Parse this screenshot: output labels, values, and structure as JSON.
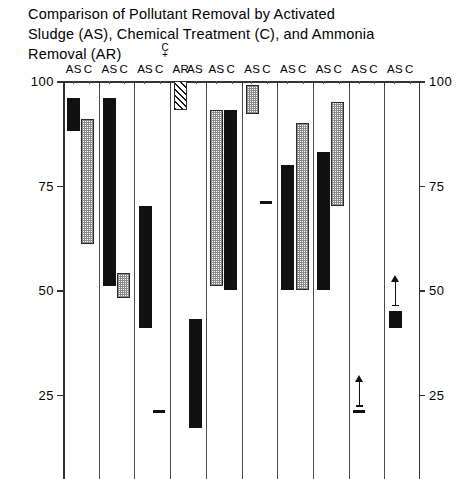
{
  "figure": {
    "title": "Comparison of Pollutant Removal by Activated\nSludge (AS), Chemical Treatment (C), and Ammonia\nRemoval (AR)",
    "width": 462,
    "height": 479,
    "ar_note": {
      "c": "C",
      "plus": "+"
    }
  },
  "chart_data": {
    "type": "bar",
    "subtype": "range-bar (floating bar showing min-max percent removal)",
    "title": "Comparison of Pollutant Removal by Activated Sludge (AS), Chemical Treatment (C), and Ammonia Removal (AR)",
    "xlabel": "",
    "ylabel": "PERCENT REMOVAL FROM RAW SEWAGE",
    "ylim": [
      0,
      100
    ],
    "yticks": [
      100,
      75,
      50,
      25
    ],
    "ytick_labels": [
      "100",
      "75",
      "50",
      "25"
    ],
    "y_axis_duplicated_right": true,
    "grid": false,
    "legend": null,
    "column_headers": [
      "AS",
      "C",
      "AS",
      "C",
      "AS",
      "C",
      "AR",
      "AS",
      "C",
      "AS",
      "C",
      "AS",
      "C",
      "AS",
      "C",
      "AS",
      "C",
      "AS",
      "C",
      "AS",
      "C"
    ],
    "groups": [
      {
        "index": 1,
        "series": [
          {
            "name": "AS",
            "fill": "solid",
            "low": 88,
            "high": 96,
            "marker": null,
            "arrow": false
          },
          {
            "name": "C",
            "fill": "stipple",
            "low": 61,
            "high": 91,
            "marker": null,
            "arrow": false
          }
        ]
      },
      {
        "index": 2,
        "series": [
          {
            "name": "AS",
            "fill": "solid",
            "low": 51,
            "high": 96,
            "marker": null,
            "arrow": false
          },
          {
            "name": "C",
            "fill": "stipple",
            "low": 48,
            "high": 54,
            "marker": null,
            "arrow": false
          }
        ]
      },
      {
        "index": 3,
        "series": [
          {
            "name": "AS",
            "fill": "solid",
            "low": 41,
            "high": 70,
            "marker": null,
            "arrow": false
          },
          {
            "name": "C",
            "fill": null,
            "low": 21,
            "high": 21,
            "marker": "dash",
            "arrow": false
          }
        ]
      },
      {
        "index": 4,
        "series": [
          {
            "name": "AR",
            "fill": "hatch",
            "low": 93,
            "high": 100,
            "marker": null,
            "arrow": false
          },
          {
            "name": "AS",
            "fill": "solid",
            "low": 17,
            "high": 43,
            "marker": null,
            "arrow": false
          }
        ]
      },
      {
        "index": 5,
        "series": [
          {
            "name": "AS",
            "fill": "stipple",
            "low": 51,
            "high": 93,
            "marker": null,
            "arrow": false
          },
          {
            "name": "C",
            "fill": "solid",
            "low": 50,
            "high": 93,
            "marker": null,
            "arrow": false
          }
        ]
      },
      {
        "index": 6,
        "series": [
          {
            "name": "AS",
            "fill": "stipple",
            "low": 92,
            "high": 99,
            "marker": null,
            "arrow": false
          },
          {
            "name": "C",
            "fill": null,
            "low": 71,
            "high": 71,
            "marker": "dash",
            "arrow": false
          }
        ]
      },
      {
        "index": 7,
        "series": [
          {
            "name": "AS",
            "fill": "solid",
            "low": 50,
            "high": 80,
            "marker": null,
            "arrow": false
          },
          {
            "name": "C",
            "fill": "stipple",
            "low": 50,
            "high": 90,
            "marker": null,
            "arrow": false
          }
        ]
      },
      {
        "index": 8,
        "series": [
          {
            "name": "AS",
            "fill": "solid",
            "low": 50,
            "high": 83,
            "marker": null,
            "arrow": false
          },
          {
            "name": "C",
            "fill": "stipple",
            "low": 70,
            "high": 95,
            "marker": null,
            "arrow": false
          }
        ]
      },
      {
        "index": 9,
        "series": [
          {
            "name": "AS",
            "fill": null,
            "low": 21,
            "high": 21,
            "marker": "dash",
            "arrow": true
          },
          {
            "name": "C",
            "fill": null,
            "low": null,
            "high": null,
            "marker": null,
            "arrow": false
          }
        ]
      },
      {
        "index": 10,
        "series": [
          {
            "name": "AS",
            "fill": "solid",
            "low": 41,
            "high": 45,
            "marker": null,
            "arrow": true
          },
          {
            "name": "C",
            "fill": null,
            "low": null,
            "high": null,
            "marker": null,
            "arrow": false
          }
        ]
      }
    ],
    "annotations": [
      {
        "text": "C",
        "note": "Group 4 left column is labelled C + AR (chemical plus ammonia removal)"
      },
      {
        "text": "+",
        "note": "combining symbol"
      },
      {
        "text": "up-arrow",
        "note": "indicates value is a lower bound / greater-than shown level"
      }
    ]
  },
  "axis": {
    "left_labels": [
      "100",
      "75",
      "50",
      "25"
    ],
    "right_labels": [
      "100",
      "75",
      "50",
      "25"
    ],
    "y_title": "PERCENT REMOVAL FROM RAW SEWAGE"
  }
}
